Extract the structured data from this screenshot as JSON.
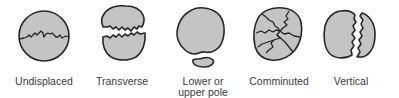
{
  "figure": {
    "title": "",
    "colors": {
      "fragment_fill": "#c4c4c4",
      "outline": "#262626",
      "label_text": "#3a3a3a",
      "background": "#ffffff"
    },
    "types": [
      {
        "id": "undisplaced",
        "label": "Undisplaced",
        "label_lines": [
          "Undisplaced"
        ]
      },
      {
        "id": "transverse",
        "label": "Transverse",
        "label_lines": [
          "Transverse"
        ]
      },
      {
        "id": "pole",
        "label": "Lower or upper pole",
        "label_lines": [
          "Lower or",
          "upper pole"
        ]
      },
      {
        "id": "comminuted",
        "label": "Comminuted",
        "label_lines": [
          "Comminuted"
        ]
      },
      {
        "id": "vertical",
        "label": "Vertical",
        "label_lines": [
          "Vertical"
        ]
      }
    ]
  }
}
